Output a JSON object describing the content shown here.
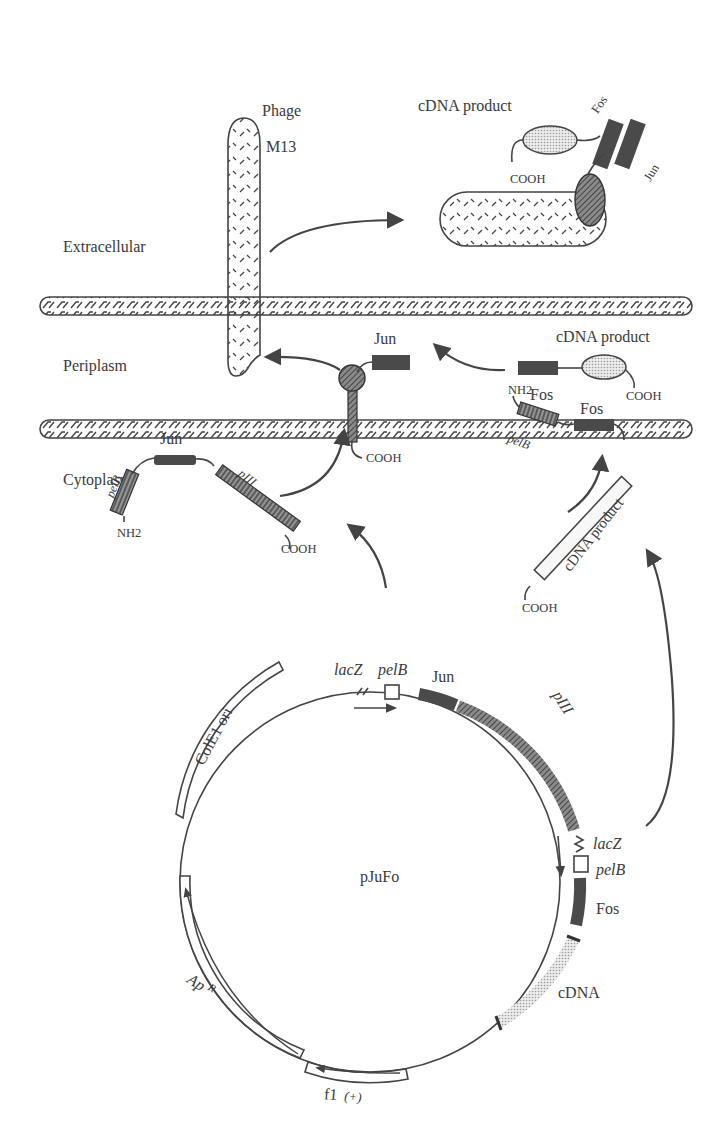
{
  "figure": {
    "compartments": {
      "extracellular": "Extracellular",
      "periplasm": "Periplasm",
      "cytoplasm": "Cytoplasm"
    },
    "phage": {
      "label_line1": "Phage",
      "label_line2": "M13"
    },
    "displayed_complex": {
      "product_label": "cDNA product",
      "fos_label": "Fos",
      "jun_label": "Jun",
      "terminus": "COOH"
    },
    "periplasm_proteins": {
      "jun_label": "Jun",
      "jun_terminus": "COOH",
      "fos_label": "Fos",
      "product_label": "cDNA product",
      "fos_terminus": "COOH"
    },
    "jun_fusion": {
      "title": "Jun",
      "signal": "pelB",
      "coat": "pIII",
      "n_term": "NH2",
      "c_term": "COOH"
    },
    "fos_fusion": {
      "title": "Fos",
      "signal": "pelB",
      "product": "cDNA product",
      "n_term": "NH2",
      "c_term": "COOH"
    },
    "plasmid": {
      "name": "pJuFo",
      "features": {
        "lacz_top": "lacZ",
        "pelb_top": "pelB",
        "jun": "Jun",
        "piii": "pIII",
        "lacz_right": "lacZ",
        "pelb_right": "pelB",
        "fos": "Fos",
        "cdna": "cDNA",
        "f1": "f1",
        "f1_strand": "(+)",
        "apr_main": "Ap",
        "apr_sup": "R",
        "cole1": "ColE1 ori"
      }
    },
    "colors": {
      "ink": "#3a3a3a",
      "dark_fill": "#4a4a4a",
      "hatch_fill": "#6e6e6e",
      "dotted_fill": "#c8c8c8",
      "background": "#ffffff"
    }
  }
}
